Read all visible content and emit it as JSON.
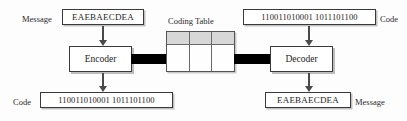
{
  "diagram": {
    "coding_table": {
      "label": "Coding Table",
      "rows": 2,
      "columns": 3,
      "header_fill": "#d7d7d7",
      "body_fill": "#fefefe"
    },
    "encoder": {
      "label": "Encoder",
      "input_label": "Message",
      "input_value": "EAEBAECDEA",
      "output_label": "Code",
      "output_value": "110011010001 1011101100"
    },
    "decoder": {
      "label": "Decoder",
      "input_label": "Code",
      "input_value": "110011010001 1011101100",
      "output_label": "Message",
      "output_value": "EAEBAECDEA"
    },
    "colors": {
      "background": "#fdfdfd",
      "stroke": "#3a3a3a",
      "connector": "#000000",
      "arrow": "#4a4a4a",
      "table_header": "#d7d7d7"
    }
  }
}
